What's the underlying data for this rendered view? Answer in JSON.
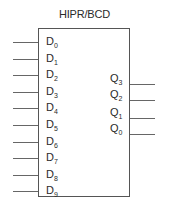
{
  "diagram": {
    "title": "HIPR/BCD",
    "inputs": [
      {
        "name": "D",
        "sub": "0"
      },
      {
        "name": "D",
        "sub": "1"
      },
      {
        "name": "D",
        "sub": "2"
      },
      {
        "name": "D",
        "sub": "3"
      },
      {
        "name": "D",
        "sub": "4"
      },
      {
        "name": "D",
        "sub": "5"
      },
      {
        "name": "D",
        "sub": "6"
      },
      {
        "name": "D",
        "sub": "7"
      },
      {
        "name": "D",
        "sub": "8"
      },
      {
        "name": "D",
        "sub": "9"
      }
    ],
    "outputs": [
      {
        "name": "Q",
        "sub": "3"
      },
      {
        "name": "Q",
        "sub": "2"
      },
      {
        "name": "Q",
        "sub": "1"
      },
      {
        "name": "Q",
        "sub": "0"
      }
    ]
  }
}
